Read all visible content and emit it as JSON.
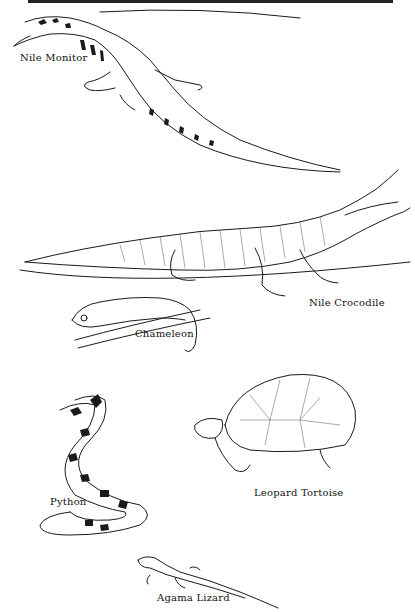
{
  "illustration": {
    "style": "black-and-white pen-and-ink drawings",
    "animals": [
      {
        "id": "nile-monitor",
        "label": "Nile Monitor"
      },
      {
        "id": "nile-crocodile",
        "label": "Nile Crocodile"
      },
      {
        "id": "chameleon",
        "label": "Chameleon"
      },
      {
        "id": "python",
        "label": "Python"
      },
      {
        "id": "leopard-tortoise",
        "label": "Leopard Tortoise"
      },
      {
        "id": "agama-lizard",
        "label": "Agama Lizard"
      }
    ]
  },
  "colors": {
    "ink": "#1a1a1a",
    "paper": "#ffffff"
  }
}
